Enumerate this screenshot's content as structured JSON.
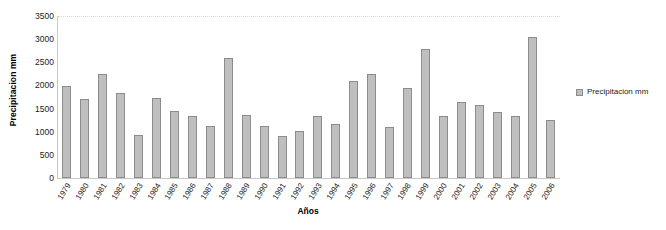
{
  "chart_data": {
    "type": "bar",
    "title": "",
    "xlabel": "Años",
    "ylabel": "Precipitacion mm",
    "ylim": [
      0,
      3500
    ],
    "ytick_step": 500,
    "yticks": [
      0,
      500,
      1000,
      1500,
      2000,
      2500,
      3000,
      3500
    ],
    "grid": "horizontal-top-only",
    "legend_position": "right",
    "legend": [
      "Precipitacion mm"
    ],
    "series_name": "Precipitacion mm",
    "bar_color": "#bfbfbf",
    "bar_border_color": "#8c8c8c",
    "categories": [
      "1979",
      "1980",
      "1981",
      "1982",
      "1983",
      "1984",
      "1985",
      "1986",
      "1987",
      "1988",
      "1989",
      "1990",
      "1991",
      "1992",
      "1993",
      "1994",
      "1995",
      "1996",
      "1997",
      "1998",
      "1999",
      "2000",
      "2001",
      "2002",
      "2003",
      "2004",
      "2005",
      "2006"
    ],
    "values": [
      1990,
      1710,
      2240,
      1830,
      930,
      1730,
      1450,
      1330,
      1120,
      2590,
      1370,
      1130,
      900,
      1020,
      1340,
      1160,
      2090,
      2250,
      1110,
      1950,
      2790,
      1340,
      1650,
      1570,
      1420,
      1330,
      3050,
      1250
    ],
    "units": "mm",
    "series": [
      {
        "name": "Precipitacion mm",
        "values": [
          1990,
          1710,
          2240,
          1830,
          930,
          1730,
          1450,
          1330,
          1120,
          2590,
          1370,
          1130,
          900,
          1020,
          1340,
          1160,
          2090,
          2250,
          1110,
          1950,
          2790,
          1340,
          1650,
          1570,
          1420,
          1330,
          3050,
          1250
        ]
      }
    ]
  }
}
